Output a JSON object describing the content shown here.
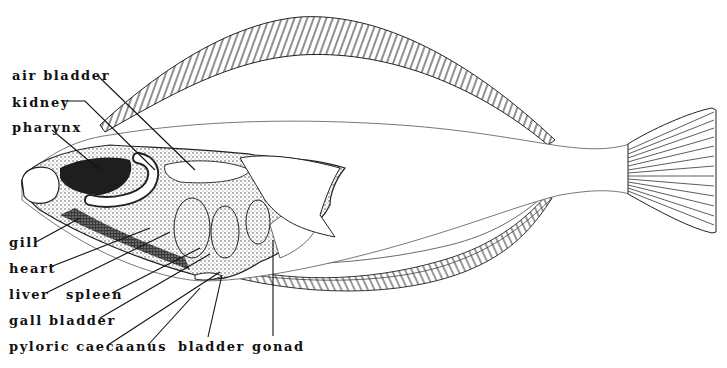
{
  "diagram": {
    "colors": {
      "ink": "#111111",
      "background": "#ffffff",
      "shade": "#555555"
    },
    "labels": [
      {
        "id": "air-bladder",
        "text": "air bladder",
        "x": 12,
        "y": 69
      },
      {
        "id": "kidney",
        "text": "kidney",
        "x": 12,
        "y": 96
      },
      {
        "id": "pharynx",
        "text": "pharynx",
        "x": 12,
        "y": 121
      },
      {
        "id": "gill",
        "text": "gill",
        "x": 9,
        "y": 236
      },
      {
        "id": "heart",
        "text": "heart",
        "x": 9,
        "y": 262
      },
      {
        "id": "liver",
        "text": "liver",
        "x": 9,
        "y": 288
      },
      {
        "id": "spleen",
        "text": "spleen",
        "x": 66,
        "y": 288
      },
      {
        "id": "gall-bladder",
        "text": "gall bladder",
        "x": 9,
        "y": 314
      },
      {
        "id": "pyloric-caeca",
        "text": "pyloric caeca",
        "x": 9,
        "y": 340
      },
      {
        "id": "anus",
        "text": "anus",
        "x": 126,
        "y": 340
      },
      {
        "id": "bladder",
        "text": "bladder",
        "x": 178,
        "y": 340
      },
      {
        "id": "gonad",
        "text": "gonad",
        "x": 252,
        "y": 340
      }
    ]
  }
}
